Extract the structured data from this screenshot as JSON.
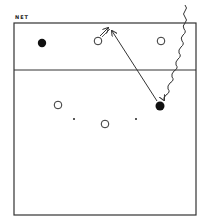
{
  "diagram": {
    "net_label": "NET",
    "colors": {
      "line": "#333333",
      "fill": "#111111",
      "background": "#ffffff"
    },
    "court": {
      "x": 14,
      "y": 23,
      "width": 182,
      "height": 192
    },
    "attack_line": {
      "y": 70
    },
    "players": [
      {
        "type": "filled",
        "x": 42,
        "y": 43
      },
      {
        "type": "open",
        "x": 98,
        "y": 41
      },
      {
        "type": "open",
        "x": 161,
        "y": 41
      },
      {
        "type": "open",
        "x": 58,
        "y": 105
      },
      {
        "type": "open",
        "x": 105,
        "y": 124
      },
      {
        "type": "filled",
        "x": 160,
        "y": 106
      }
    ],
    "markers": [
      {
        "x": 74,
        "y": 119
      },
      {
        "x": 136,
        "y": 119
      }
    ]
  }
}
